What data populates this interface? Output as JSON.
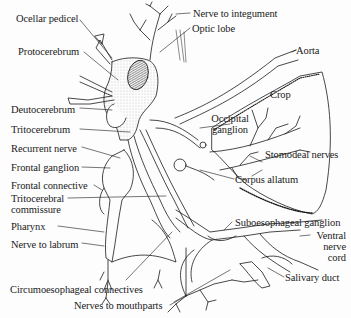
{
  "diagram": {
    "labels": {
      "ocellar_pedicel": "Ocellar pedicel",
      "protocerebrum": "Protocerebrum",
      "deutocerebrum": "Deutocerebrum",
      "tritocerebrum": "Tritocerebrum",
      "recurrent_nerve": "Recurrent nerve",
      "frontal_ganglion": "Frontal ganglion",
      "frontal_connective": "Frontal connective",
      "tritocerebral_commissure_1": "Tritocerebral",
      "tritocerebral_commissure_2": "commissure",
      "pharynx": "Pharynx",
      "nerve_to_labrum": "Nerve to labrum",
      "circumoesophageal_connectives": "Circumoesophageal connectives",
      "nerves_to_mouthparts": "Nerves to mouthparts",
      "nerve_to_integument": "Nerve to integument",
      "optic_lobe": "Optic lobe",
      "aorta": "Aorta",
      "crop": "Crop",
      "occipital_ganglion_1": "Occipital",
      "occipital_ganglion_2": "ganglion",
      "stomodeal_nerves": "Stomodeal nerves",
      "corpus_allatum": "Corpus allatum",
      "suboesophageal_ganglion": "Suboesophageal ganglion",
      "ventral_nerve_cord_1": "Ventral",
      "ventral_nerve_cord_2": "nerve",
      "ventral_nerve_cord_3": "cord",
      "salivary_duct": "Salivary duct"
    },
    "colors": {
      "ink": "#1a1a1a",
      "background": "#fdfdfd",
      "stipple": "#9a9a9a"
    }
  }
}
